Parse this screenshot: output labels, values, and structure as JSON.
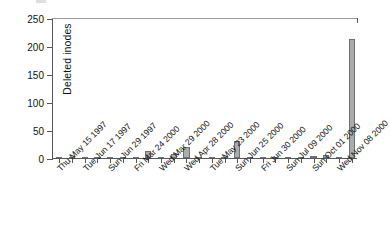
{
  "chart_data": {
    "type": "bar",
    "title": "",
    "xlabel": "",
    "ylabel": "Deleted inodes",
    "ylim": [
      0,
      250
    ],
    "yticks": [
      0,
      50,
      100,
      150,
      200,
      250
    ],
    "ytick_labels": [
      "0",
      "50",
      "100",
      "150",
      "200",
      "250"
    ],
    "grid": false,
    "legend": null,
    "bar_color": "#aaabad",
    "bar_edge_color": "#6e7072",
    "axis_color": "#55575a",
    "categories": [
      "Thu May 15 1997",
      "",
      "Tue Jun 17 1997",
      "",
      "Sun Jun 29 1997",
      "",
      "Fri Mar 24 2000",
      "",
      "Wed Mar 29 2000",
      "",
      "Wed Apr 28 2000",
      "",
      "Tue May 23 2000",
      "",
      "Sun Jun 25 2000",
      "",
      "Fri Jun 30 2000",
      "",
      "Sun Jul 09 2000",
      "",
      "Sun Oct 01 2000",
      "",
      "Wed Nov 08 2000",
      ""
    ],
    "tick_labels": [
      "Thu May 15 1997",
      "Tue Jun 17 1997",
      "Sun Jun 29 1997",
      "Fri Mar 24 2000",
      "Wed Mar 29 2000",
      "Wed Apr 28 2000",
      "Tue May 23 2000",
      "Sun Jun 25 2000",
      "Fri Jun 30 2000",
      "Sun Jul 09 2000",
      "Sun Oct 01 2000",
      "Wed Nov 08 2000"
    ],
    "values": [
      0,
      0,
      0,
      0,
      0,
      0,
      0,
      12,
      0,
      7,
      19,
      0,
      0,
      0,
      30,
      0,
      0,
      0,
      0,
      0,
      3,
      6,
      0,
      212
    ]
  }
}
